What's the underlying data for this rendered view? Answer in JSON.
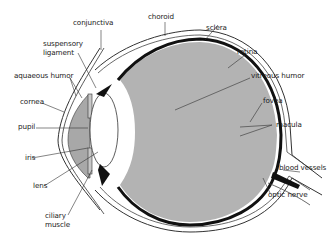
{
  "diagram": {
    "colors": {
      "vitreous_fill": "#b3b3b3",
      "choroid_retina": "#111111",
      "lens_fill": "#ffffff",
      "outline": "#333333",
      "background": "#ffffff"
    },
    "labels": {
      "conjunctiva": "conjunctiva",
      "choroid": "choroid",
      "sclera": "sclera",
      "suspensory_1": "suspensory",
      "suspensory_2": "ligament",
      "retina": "retina",
      "aqueous": "aquaeous humor",
      "vitreous": "vitreous humor",
      "cornea": "cornea",
      "fovea": "fovea",
      "pupil": "pupil",
      "macula": "macula",
      "iris": "iris",
      "blood_vessels": "blood vessels",
      "lens": "lens",
      "optic_nerve": "optic nerve",
      "ciliary_1": "ciliary",
      "ciliary_2": "muscle"
    }
  }
}
